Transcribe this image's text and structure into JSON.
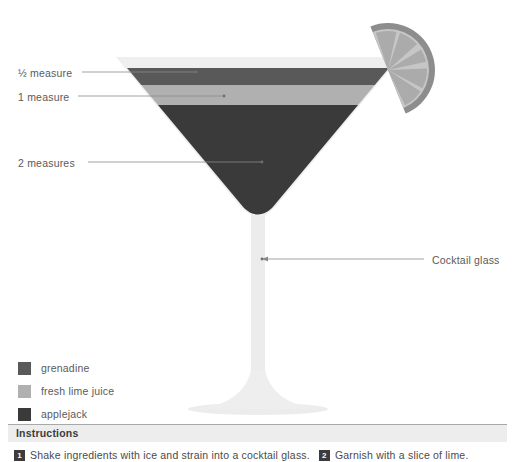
{
  "diagram": {
    "callouts": [
      {
        "name": "half-measure",
        "label": "½ measure",
        "target": "grenadine"
      },
      {
        "name": "one-measure",
        "label": "1 measure",
        "target": "fresh lime juice"
      },
      {
        "name": "two-measures",
        "label": "2 measures",
        "target": "applejack"
      },
      {
        "name": "cocktail-glass",
        "label": "Cocktail glass",
        "target": "glass"
      }
    ],
    "glass": {
      "type": "cocktail glass",
      "body_color": "#efefef",
      "stem_color": "#ececec",
      "outline_color": "#e2e2e2"
    },
    "garnish": {
      "name": "lime-slice",
      "label": "slice of lime",
      "flesh_color": "#b4b4b4",
      "rind_color": "#8d8d8d",
      "segments": 6
    }
  },
  "legend": {
    "items": [
      {
        "name": "grenadine",
        "label": "grenadine",
        "color": "#595959",
        "measure": "½ measure"
      },
      {
        "name": "fresh-lime-juice",
        "label": "fresh lime juice",
        "color": "#b0b0b0",
        "measure": "1 measure"
      },
      {
        "name": "applejack",
        "label": "applejack",
        "color": "#3a3a3a",
        "measure": "2 measures"
      }
    ]
  },
  "instructions": {
    "title": "Instructions",
    "steps": [
      {
        "number": "1",
        "text": "Shake ingredients with ice and strain into a cocktail glass."
      },
      {
        "number": "2",
        "text": "Garnish with a slice of lime."
      }
    ]
  },
  "colors": {
    "background": "#ffffff",
    "text": "#5a5a5a",
    "leader_line": "#8a8a8a",
    "band": "#ededed",
    "rule": "#a8a8a8"
  }
}
